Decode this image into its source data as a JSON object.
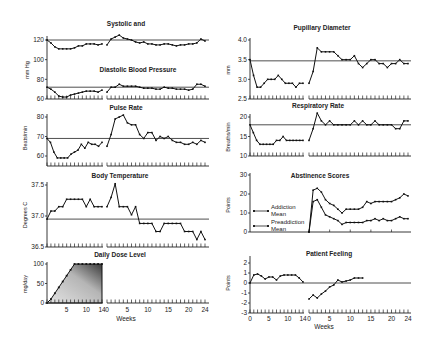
{
  "chart_data": [
    {
      "id": "bp",
      "type": "line",
      "title": "Systolic and Diastolic Blood Pressure",
      "title_lines": [
        "Systolic and",
        "Diastolic Blood Pressure"
      ],
      "ylabel": "mm Hg",
      "ylim": [
        60,
        120
      ],
      "yticks": [
        120,
        100,
        80,
        60
      ],
      "xlabel": "",
      "phases": [
        "Preaddiction (weeks 0-14)",
        "Addiction (weeks 0-24)"
      ],
      "series": [
        {
          "name": "Systolic",
          "reference": 120,
          "phase1": [
            120,
            117,
            113,
            111,
            111,
            111,
            111,
            112,
            114,
            114,
            116,
            116,
            116,
            115,
            116
          ],
          "phase2": [
            115,
            121,
            123,
            125,
            122,
            121,
            120,
            118,
            117,
            118,
            116,
            116,
            115,
            115,
            116,
            116,
            115,
            114,
            115,
            115,
            116,
            116,
            117,
            121,
            119
          ]
        },
        {
          "name": "Diastolic",
          "reference": 72,
          "phase1": [
            72,
            70,
            67,
            63,
            62,
            62,
            64,
            65,
            66,
            67,
            68,
            68,
            68,
            67,
            69
          ],
          "phase2": [
            67,
            72,
            72,
            75,
            73,
            73,
            73,
            73,
            72,
            71,
            71,
            71,
            70,
            70,
            72,
            71,
            71,
            70,
            70,
            70,
            69,
            70,
            75,
            75,
            73
          ]
        }
      ]
    },
    {
      "id": "pulse",
      "type": "line",
      "title": "Pulse Rate",
      "ylabel": "Beats/min",
      "ylim": [
        55,
        80
      ],
      "yticks": [
        80,
        70,
        60
      ],
      "reference": 69,
      "phase1": [
        69,
        67,
        62,
        59,
        59,
        59,
        59,
        61,
        62,
        63,
        66,
        64,
        67,
        66,
        66,
        65,
        67
      ],
      "phase2": [
        65,
        71,
        79,
        80,
        81,
        77,
        76,
        76,
        71,
        69,
        72,
        72,
        68,
        70,
        69,
        70,
        68,
        67,
        67,
        66,
        66,
        67,
        66,
        68,
        67
      ]
    },
    {
      "id": "temp",
      "type": "line",
      "title": "Body Temperature",
      "ylabel": "Degrees C",
      "ylim": [
        36.5,
        37.5
      ],
      "yticks": [
        37.5,
        37.0,
        36.5
      ],
      "reference": 36.95,
      "phase1": [
        36.95,
        37.08,
        37.08,
        37.15,
        37.15,
        37.27,
        37.27,
        37.27,
        37.27,
        37.27,
        37.15,
        37.27,
        37.15,
        37.15,
        37.15
      ],
      "phase2": [
        37.15,
        37.3,
        37.52,
        37.15,
        37.15,
        37.15,
        37.02,
        37.15,
        36.88,
        36.88,
        36.88,
        36.88,
        36.75,
        36.75,
        36.88,
        36.88,
        36.88,
        36.88,
        36.88,
        36.75,
        36.75,
        36.75,
        36.62,
        36.75,
        36.62
      ]
    },
    {
      "id": "dose",
      "type": "area",
      "title": "Daily Dose Level",
      "ylabel": "mg/day",
      "ylim": [
        0,
        100
      ],
      "yticks": [
        100,
        50,
        0
      ],
      "xlabel": "Weeks",
      "x_phase1": [
        0,
        1,
        2,
        3,
        4,
        5,
        6,
        7,
        8,
        9,
        10,
        11,
        12,
        13,
        14
      ],
      "values_phase1": [
        0,
        10,
        25,
        40,
        55,
        70,
        85,
        100,
        100,
        100,
        100,
        100,
        100,
        100,
        100
      ],
      "xticks_phase1": [
        5,
        10,
        14
      ],
      "xticks_phase2": [
        0,
        5,
        10,
        15,
        20,
        24
      ]
    },
    {
      "id": "pupil",
      "type": "line",
      "title": "Pupillary Diameter",
      "ylabel": "mm",
      "ylim": [
        2.5,
        4.0
      ],
      "yticks": [
        4.0,
        3.5,
        3.0,
        2.5
      ],
      "reference": 3.47,
      "phase1": [
        3.5,
        3.1,
        2.8,
        2.8,
        2.9,
        3.0,
        3.0,
        3.0,
        3.1,
        3.0,
        2.9,
        2.9,
        2.9,
        2.8,
        2.9,
        2.9
      ],
      "phase2": [
        2.9,
        3.2,
        3.8,
        3.7,
        3.7,
        3.7,
        3.7,
        3.6,
        3.5,
        3.5,
        3.5,
        3.6,
        3.4,
        3.3,
        3.4,
        3.5,
        3.5,
        3.4,
        3.4,
        3.3,
        3.4,
        3.4,
        3.5,
        3.4,
        3.4
      ]
    },
    {
      "id": "resp",
      "type": "line",
      "title": "Respiratory Rate",
      "ylabel": "Breaths/min",
      "ylim": [
        10,
        20
      ],
      "yticks": [
        20,
        15,
        10
      ],
      "reference": 18,
      "phase1": [
        18,
        16,
        14,
        13,
        13,
        13,
        13,
        13,
        14,
        14,
        15,
        14,
        14,
        14,
        14,
        14,
        14
      ],
      "phase2": [
        14,
        17,
        21,
        19,
        18,
        19,
        18,
        18,
        18,
        18,
        18,
        19,
        18,
        19,
        18,
        18,
        19,
        18,
        18,
        18,
        18,
        17,
        17,
        19,
        19
      ]
    },
    {
      "id": "abstinence",
      "type": "line",
      "title": "Abstinence Scores",
      "ylabel": "Points",
      "ylim": [
        0,
        30
      ],
      "yticks": [
        30,
        20,
        10,
        0
      ],
      "legend": [
        "Addiction Mean",
        "Preaddiction Mean"
      ],
      "series": [
        {
          "name": "Addiction Mean",
          "phase2": [
            0,
            22,
            23,
            21,
            17,
            15,
            14,
            12,
            10,
            12,
            12,
            12,
            12,
            13,
            16,
            15,
            16,
            16,
            16,
            16,
            16,
            17,
            18,
            20,
            19
          ]
        },
        {
          "name": "Preaddiction Mean",
          "phase2": [
            0,
            16,
            17,
            13,
            9,
            8,
            7,
            6,
            4,
            5,
            5,
            5,
            5,
            5,
            6,
            6,
            7,
            6,
            7,
            6,
            6,
            7,
            8,
            7,
            7
          ]
        }
      ]
    },
    {
      "id": "feeling",
      "type": "line",
      "title": "Patient Feeling",
      "ylabel": "Points",
      "ylim": [
        -3,
        3
      ],
      "yticks": [
        2,
        1,
        0,
        -1,
        -2,
        -3
      ],
      "reference": 0,
      "xlabel": "Weeks",
      "phase1": [
        0,
        0.8,
        0.9,
        0.7,
        0.4,
        0.6,
        0.6,
        0.3,
        0.7,
        0.8,
        0.8,
        0.8,
        0.8,
        0.5,
        0.1
      ],
      "phase2": [
        -1.6,
        -1.2,
        -1.5,
        -1.1,
        -0.8,
        -0.4,
        -0.2,
        0.3,
        0.1,
        0.2,
        0.3,
        0.5,
        0.5,
        0.5
      ],
      "xticks_phase1": [
        0,
        5,
        10,
        14
      ],
      "xticks_phase2": [
        0,
        5,
        10,
        15,
        20,
        24
      ]
    }
  ],
  "labels": {
    "bp_title_1": "Systolic and",
    "bp_title_2": "Diastolic Blood Pressure",
    "bp_ylabel": "mm Hg",
    "pulse_title": "Pulse Rate",
    "pulse_ylabel": "Beats/min",
    "temp_title": "Body Temperature",
    "temp_ylabel": "Degrees C",
    "dose_title": "Daily Dose Level",
    "dose_ylabel": "mg/day",
    "pupil_title": "Pupillary Diameter",
    "pupil_ylabel": "mm",
    "resp_title": "Respiratory Rate",
    "resp_ylabel": "Breaths/min",
    "abst_title": "Abstinence Scores",
    "abst_ylabel": "Points",
    "abst_legend_1a": "Addiction",
    "abst_legend_1b": "Mean",
    "abst_legend_2a": "Preaddiction",
    "abst_legend_2b": "Mean",
    "feel_title": "Patient Feeling",
    "feel_ylabel": "Points",
    "weeks": "Weeks"
  }
}
